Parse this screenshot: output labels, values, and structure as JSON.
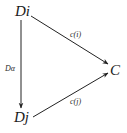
{
  "diagram": {
    "type": "commutative-triangle",
    "nodes": {
      "di": "Di",
      "dj": "Dj",
      "c": "C"
    },
    "edges": {
      "di_to_c": {
        "label": "c(i)",
        "from": "Di",
        "to": "C"
      },
      "dj_to_c": {
        "label": "c(j)",
        "from": "Dj",
        "to": "C"
      },
      "di_to_dj": {
        "label": "Dα",
        "from": "Di",
        "to": "Dj"
      }
    },
    "colors": {
      "ink": "#222222",
      "background": "#ffffff"
    }
  }
}
